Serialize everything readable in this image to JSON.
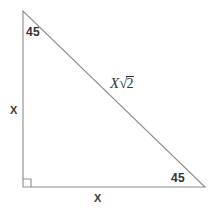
{
  "figure": {
    "type": "geometry-diagram",
    "background_color": "#ffffff",
    "stroke_color": "#8c8c8c",
    "text_color": "#333333"
  },
  "geometry": {
    "vertices": {
      "top": {
        "x": 23,
        "y": 11
      },
      "bottom_left": {
        "x": 23,
        "y": 187
      },
      "bottom_right": {
        "x": 205,
        "y": 187
      }
    },
    "right_angle_marker": {
      "x": 23,
      "y": 187,
      "size": 8
    }
  },
  "labels": {
    "angle_top_left": "45",
    "angle_bottom_right": "45",
    "side_left": "X",
    "side_bottom": "X",
    "hypotenuse_coefficient": "X",
    "hypotenuse_radical_sign": "√",
    "hypotenuse_radicand": "2"
  }
}
